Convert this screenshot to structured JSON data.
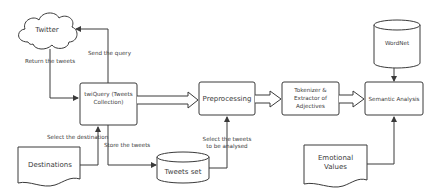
{
  "nodes": {
    "twitter": {
      "label": "Twitter",
      "shape": "cloud"
    },
    "twiquery": {
      "line1": "twiQuery (Tweets",
      "line2": "Collection)",
      "shape": "process"
    },
    "preprocessing": {
      "label": "Preprocessing",
      "shape": "process"
    },
    "tokenizer": {
      "line1": "Tokenizer &",
      "line2": "Extractor of",
      "line3": "Adjectives",
      "shape": "process"
    },
    "semantic": {
      "label": "Semantic Analysis",
      "shape": "process"
    },
    "wordnet": {
      "label": "WordNet",
      "shape": "database"
    },
    "destinations": {
      "label": "Destinations",
      "shape": "document"
    },
    "tweets_set": {
      "label": "Tweets set",
      "shape": "database"
    },
    "emotional": {
      "line1": "Emotional",
      "line2": "Values",
      "shape": "document"
    }
  },
  "edges": {
    "send_query": "Send the query",
    "return_tweets": "Return the tweets",
    "select_destination": "Select the destination",
    "store_tweets": "Store the tweets",
    "select_tweets_1": "Select the tweets",
    "select_tweets_2": "to be analysed"
  },
  "colors": {
    "stroke": "#3a3a3a",
    "fill": "#ffffff",
    "text": "#3a3a3a"
  }
}
